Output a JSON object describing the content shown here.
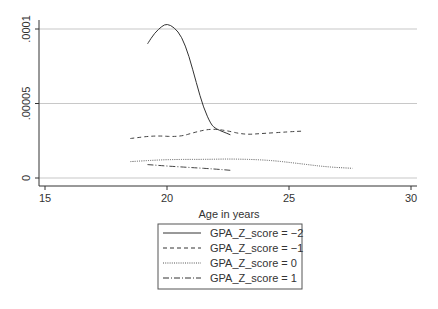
{
  "chart_data": {
    "type": "line",
    "title": "",
    "xlabel": "Age in years",
    "ylabel": "",
    "xlim": [
      15,
      30
    ],
    "ylim": [
      0,
      0.0001
    ],
    "grid": true,
    "x_ticks": [
      "15",
      "20",
      "25",
      "30"
    ],
    "y_ticks": [
      "0",
      ".00005",
      ".0001"
    ],
    "legend_position": "bottom",
    "series": [
      {
        "name": "GPA_Z_score = −2",
        "style": "solid",
        "x": [
          19.2,
          19.5,
          19.8,
          20.0,
          20.3,
          20.6,
          20.9,
          21.2,
          21.5,
          21.8,
          22.0,
          22.3,
          22.6
        ],
        "y": [
          9e-05,
          9.75e-05,
          0.000102,
          0.0001035,
          0.000101,
          9.5e-05,
          8.2e-05,
          6.4e-05,
          4.7e-05,
          3.6e-05,
          3.3e-05,
          3.1e-05,
          2.9e-05
        ]
      },
      {
        "name": "GPA_Z_score = −1",
        "style": "dashed",
        "x": [
          18.5,
          19.5,
          20.5,
          21.2,
          21.8,
          22.4,
          23.2,
          24.0,
          25.0,
          25.6
        ],
        "y": [
          2.65e-05,
          2.85e-05,
          2.75e-05,
          3.1e-05,
          3.3e-05,
          3.2e-05,
          2.9e-05,
          3e-05,
          3.1e-05,
          3.15e-05
        ]
      },
      {
        "name": "GPA_Z_score = 0",
        "style": "dotted",
        "x": [
          18.5,
          19.5,
          20.5,
          21.5,
          22.5,
          23.5,
          24.5,
          25.5,
          26.5,
          27.6
        ],
        "y": [
          1.1e-05,
          1.2e-05,
          1.25e-05,
          1.25e-05,
          1.28e-05,
          1.25e-05,
          1.15e-05,
          9.5e-06,
          7.5e-06,
          6.5e-06
        ]
      },
      {
        "name": "GPA_Z_score = 1",
        "style": "dashdot",
        "x": [
          19.2,
          20.0,
          21.0,
          22.0,
          22.6
        ],
        "y": [
          9e-06,
          8e-06,
          7e-06,
          6e-06,
          5.2e-06
        ]
      }
    ]
  },
  "legend": {
    "items": [
      {
        "label": "GPA_Z_score = −2"
      },
      {
        "label": "GPA_Z_score = −1"
      },
      {
        "label": "GPA_Z_score = 0"
      },
      {
        "label": "GPA_Z_score = 1"
      }
    ]
  },
  "axes": {
    "x_label": "Age in years",
    "x_ticks": [
      "15",
      "20",
      "25",
      "30"
    ],
    "y_ticks": [
      "0",
      ".00005",
      ".0001"
    ]
  }
}
